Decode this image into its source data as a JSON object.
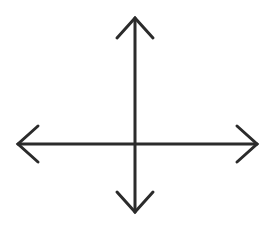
{
  "document": {
    "title": "Four-Way Arrow Diagram",
    "kind": "line-drawing",
    "caption": ""
  },
  "canvas": {
    "width": 273,
    "height": 229,
    "background_color": "#ffffff",
    "border": "none"
  },
  "figure": {
    "name": "four-way-directional-arrow",
    "stroke_color": "#2b2b2b",
    "stroke_width": 3,
    "stroke_linecap": "round",
    "stroke_linejoin": "miter",
    "arrowhead_style": "open-chevron",
    "center": {
      "x": 135,
      "y": 144
    },
    "axes": [
      {
        "name": "vertical-axis",
        "orientation": "vertical",
        "x": 135,
        "start_y": 18,
        "end_y": 212,
        "length": 194,
        "double_headed": true
      },
      {
        "name": "horizontal-axis",
        "orientation": "horizontal",
        "y": 144,
        "start_x": 18,
        "end_x": 257,
        "length": 239,
        "double_headed": true
      }
    ],
    "arrowheads": [
      {
        "name": "arrowhead-up",
        "direction": "up",
        "tip": {
          "x": 135,
          "y": 18
        },
        "arm_left": {
          "x": 117,
          "y": 38
        },
        "arm_right": {
          "x": 153,
          "y": 38
        }
      },
      {
        "name": "arrowhead-down",
        "direction": "down",
        "tip": {
          "x": 135,
          "y": 212
        },
        "arm_left": {
          "x": 117,
          "y": 192
        },
        "arm_right": {
          "x": 153,
          "y": 192
        }
      },
      {
        "name": "arrowhead-left",
        "direction": "left",
        "tip": {
          "x": 18,
          "y": 144
        },
        "arm_top": {
          "x": 38,
          "y": 126
        },
        "arm_bottom": {
          "x": 38,
          "y": 162
        }
      },
      {
        "name": "arrowhead-right",
        "direction": "right",
        "tip": {
          "x": 257,
          "y": 144
        },
        "arm_top": {
          "x": 237,
          "y": 126
        },
        "arm_bottom": {
          "x": 237,
          "y": 162
        }
      }
    ]
  }
}
